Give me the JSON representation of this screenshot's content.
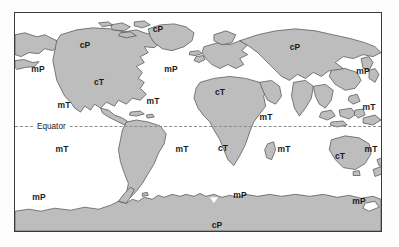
{
  "figure": {
    "frame_color": "#3a3a3a",
    "ocean_color": "#ffffff",
    "land_color": "#bdbdbd",
    "coast_color": "#4a4a4a",
    "label_color": "#1a1a1a"
  },
  "equator": {
    "label": "Equator",
    "line_style": "dashed",
    "line_color": "#8d8d8d",
    "y_fraction": 0.515
  },
  "legend_keys": {
    "cP": "continental Polar",
    "mP": "maritime Polar",
    "cT": "continental Tropical",
    "mT": "maritime Tropical"
  },
  "labels": [
    {
      "text": "cP",
      "x": 84,
      "y": 44,
      "region": "north-america-canada"
    },
    {
      "text": "cP",
      "x": 157,
      "y": 28,
      "region": "greenland"
    },
    {
      "text": "cP",
      "x": 294,
      "y": 46,
      "region": "siberia-asia"
    },
    {
      "text": "cP",
      "x": 216,
      "y": 224,
      "region": "antarctica"
    },
    {
      "text": "mP",
      "x": 37,
      "y": 68,
      "region": "north-pacific-east"
    },
    {
      "text": "mP",
      "x": 170,
      "y": 68,
      "region": "north-atlantic"
    },
    {
      "text": "mP",
      "x": 362,
      "y": 70,
      "region": "north-pacific-west"
    },
    {
      "text": "mP",
      "x": 38,
      "y": 196,
      "region": "south-pacific-east"
    },
    {
      "text": "mP",
      "x": 239,
      "y": 194,
      "region": "south-indian-ocean"
    },
    {
      "text": "mP",
      "x": 358,
      "y": 200,
      "region": "south-pacific-west"
    },
    {
      "text": "cT",
      "x": 98,
      "y": 81,
      "region": "southwest-north-america"
    },
    {
      "text": "cT",
      "x": 219,
      "y": 91,
      "region": "sahara-north-africa"
    },
    {
      "text": "cT",
      "x": 222,
      "y": 147,
      "region": "southern-africa"
    },
    {
      "text": "cT",
      "x": 339,
      "y": 155,
      "region": "australia"
    },
    {
      "text": "mT",
      "x": 63,
      "y": 104,
      "region": "east-pacific-north"
    },
    {
      "text": "mT",
      "x": 152,
      "y": 100,
      "region": "tropical-atlantic"
    },
    {
      "text": "mT",
      "x": 265,
      "y": 116,
      "region": "indian-ocean-north"
    },
    {
      "text": "mT",
      "x": 368,
      "y": 106,
      "region": "west-pacific-north"
    },
    {
      "text": "mT",
      "x": 61,
      "y": 148,
      "region": "east-pacific-south"
    },
    {
      "text": "mT",
      "x": 181,
      "y": 148,
      "region": "south-atlantic"
    },
    {
      "text": "mT",
      "x": 283,
      "y": 148,
      "region": "indian-ocean-south"
    },
    {
      "text": "mT",
      "x": 370,
      "y": 148,
      "region": "coral-sea"
    }
  ]
}
